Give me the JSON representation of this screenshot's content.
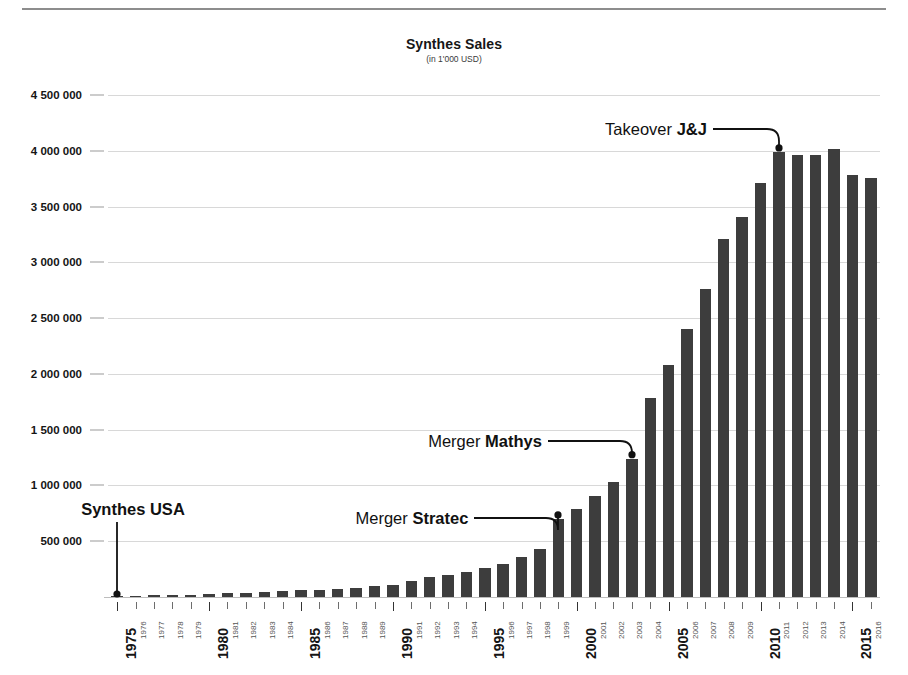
{
  "chart_data": {
    "type": "bar",
    "title": "Synthes Sales",
    "subtitle": "(in 1'000 USD)",
    "xlabel": "",
    "ylabel": "",
    "ylim": [
      0,
      4500000
    ],
    "grid": true,
    "legend": "none",
    "ytick_labels": [
      "4 500 000",
      "4 000 000",
      "3 500 000",
      "3 000 000",
      "2 500 000",
      "2 000 000",
      "1 500 000",
      "1 000 000",
      "500 000"
    ],
    "ytick_values": [
      4500000,
      4000000,
      3500000,
      3000000,
      2500000,
      2000000,
      1500000,
      1000000,
      500000
    ],
    "categories": [
      "1975",
      "1976",
      "1977",
      "1978",
      "1979",
      "1980",
      "1981",
      "1982",
      "1983",
      "1984",
      "1985",
      "1986",
      "1987",
      "1988",
      "1989",
      "1990",
      "1991",
      "1992",
      "1993",
      "1994",
      "1995",
      "1996",
      "1997",
      "1998",
      "1999",
      "2000",
      "2001",
      "2002",
      "2003",
      "2004",
      "2005",
      "2006",
      "2007",
      "2008",
      "2009",
      "2010",
      "2011",
      "2012",
      "2013",
      "2014",
      "2015",
      "2016"
    ],
    "major_categories": [
      "1975",
      "1980",
      "1985",
      "1990",
      "1995",
      "2000",
      "2005",
      "2010",
      "2015"
    ],
    "values": [
      2000,
      6000,
      14000,
      17000,
      21000,
      27000,
      33000,
      38000,
      45000,
      52000,
      60000,
      66000,
      74000,
      85000,
      96000,
      112000,
      140000,
      175000,
      198000,
      228000,
      262000,
      300000,
      355000,
      430000,
      700000,
      790000,
      910000,
      1030000,
      1240000,
      1780000,
      2080000,
      2400000,
      2760000,
      3210000,
      3410000,
      3710000,
      3990000,
      3960000,
      3960000,
      4020000,
      3780000,
      3760000
    ],
    "bar_color": "#3d3d3d",
    "grid_color": "#d8d8d8",
    "annotations": [
      {
        "id": "synthes-usa",
        "text": "Synthes USA",
        "bold_part": "Synthes USA",
        "regular_part": "",
        "target_category": "1975",
        "target_value": 0
      },
      {
        "id": "merger-stratec",
        "text": "Merger Stratec",
        "regular_part": "Merger ",
        "bold_part": "Stratec",
        "target_category": "1999",
        "target_value": 700000
      },
      {
        "id": "merger-mathys",
        "text": "Merger Mathys",
        "regular_part": "Merger ",
        "bold_part": "Mathys",
        "target_category": "2003",
        "target_value": 1240000
      },
      {
        "id": "takeover-jj",
        "text": "Takeover J&J",
        "regular_part": "Takeover ",
        "bold_part": "J&J",
        "target_category": "2011",
        "target_value": 3990000
      }
    ]
  }
}
